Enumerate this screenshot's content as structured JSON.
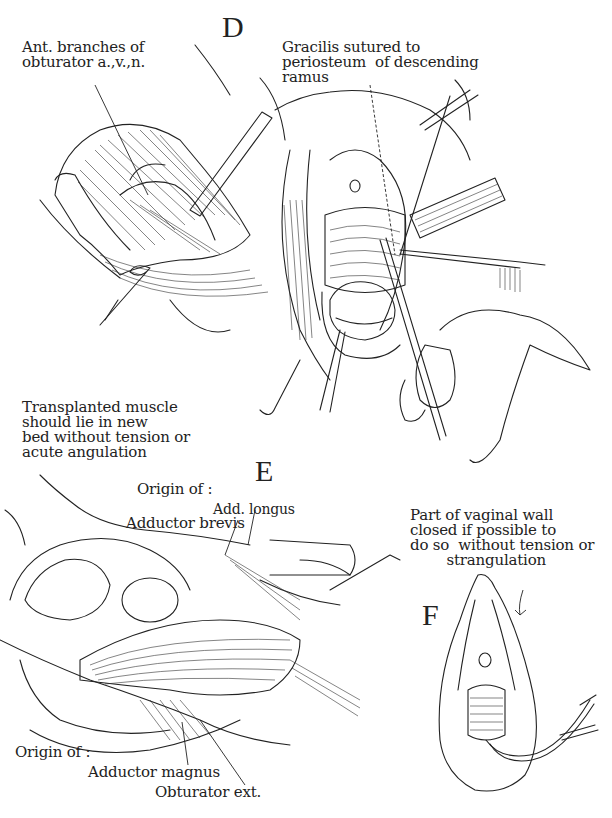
{
  "figure": {
    "panels": [
      {
        "id": "D",
        "letter": "D",
        "labels": {
          "ant_branches": "Ant. branches of\nobturator a.,v.,n.",
          "gracilis": "Gracilis sutured to\nperiosteum  of descending\nramus"
        }
      },
      {
        "id": "E",
        "letter": "E",
        "labels": {
          "transplanted": "Transplanted muscle\nshould lie in new\nbed without tension or\nacute angulation",
          "origin_top": "Origin of :",
          "add_longus": "Add. longus",
          "adductor_brevis": "Adductor brevis",
          "origin_bottom": "Origin of :",
          "adductor_magnus": "Adductor magnus",
          "obturator_ext": "Obturator ext."
        }
      },
      {
        "id": "F",
        "letter": "F",
        "labels": {
          "vaginal_wall": "Part of vaginal wall\nclosed if possible to\ndo so  without tension or\n        strangulation"
        }
      }
    ]
  }
}
